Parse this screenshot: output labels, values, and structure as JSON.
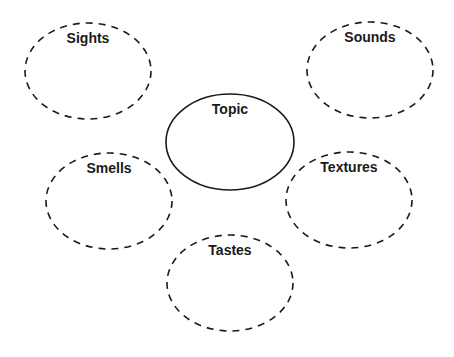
{
  "diagram": {
    "type": "sensory-details-web",
    "center": {
      "label": "Topic",
      "cx": 230,
      "cy": 142,
      "rx": 64,
      "ry": 48,
      "border": "solid"
    },
    "nodes": [
      {
        "id": "sights",
        "label": "Sights",
        "cx": 88,
        "cy": 71,
        "rx": 63,
        "ry": 48,
        "border": "dashed"
      },
      {
        "id": "sounds",
        "label": "Sounds",
        "cx": 370,
        "cy": 70,
        "rx": 63,
        "ry": 48,
        "border": "dashed"
      },
      {
        "id": "smells",
        "label": "Smells",
        "cx": 109,
        "cy": 201,
        "rx": 63,
        "ry": 48,
        "border": "dashed"
      },
      {
        "id": "textures",
        "label": "Textures",
        "cx": 349,
        "cy": 200,
        "rx": 63,
        "ry": 48,
        "border": "dashed"
      },
      {
        "id": "tastes",
        "label": "Tastes",
        "cx": 230,
        "cy": 283,
        "rx": 63,
        "ry": 48,
        "border": "dashed"
      }
    ],
    "colors": {
      "stroke": "#1a1a1a",
      "background": "#ffffff"
    }
  }
}
